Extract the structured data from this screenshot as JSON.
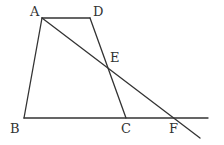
{
  "diagram": {
    "points": {
      "A": {
        "x": 42,
        "y": 18,
        "label": "A",
        "lx": 30,
        "ly": 16
      },
      "D": {
        "x": 90,
        "y": 18,
        "label": "D",
        "lx": 93,
        "ly": 16
      },
      "B": {
        "x": 24,
        "y": 118,
        "label": "B",
        "lx": 10,
        "ly": 133
      },
      "C": {
        "x": 126,
        "y": 118,
        "label": "C",
        "lx": 121,
        "ly": 133
      },
      "E": {
        "x": 108,
        "y": 68,
        "label": "E",
        "lx": 110,
        "ly": 62
      },
      "F": {
        "x": 174,
        "y": 118,
        "label": "F",
        "lx": 169,
        "ly": 133
      }
    },
    "segments": [
      {
        "name": "AD",
        "from": "A",
        "to": "D"
      },
      {
        "name": "AB",
        "from": "A",
        "to": "B"
      },
      {
        "name": "DC",
        "from": "D",
        "to": "C"
      },
      {
        "name": "BF-extended",
        "from": "B",
        "to": {
          "x": 208,
          "y": 118
        }
      },
      {
        "name": "AF-extended",
        "from": "A",
        "to": {
          "x": 200,
          "y": 138
        }
      }
    ]
  }
}
